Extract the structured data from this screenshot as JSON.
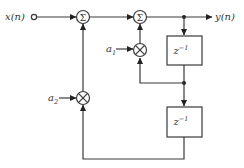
{
  "diagram": {
    "type": "second-order IIR filter block diagram",
    "input_label": "x(n)",
    "output_label": "y(n)",
    "adders": [
      {
        "id": "sum1",
        "symbol": "Σ"
      },
      {
        "id": "sum2",
        "symbol": "Σ"
      }
    ],
    "multipliers": [
      {
        "id": "mul1",
        "coefficient": "a",
        "subscript": "1"
      },
      {
        "id": "mul2",
        "coefficient": "a",
        "subscript": "2"
      }
    ],
    "delays": [
      {
        "id": "delay1",
        "base": "z",
        "exponent": "−1"
      },
      {
        "id": "delay2",
        "base": "z",
        "exponent": "−1"
      }
    ],
    "colors": {
      "line": "#3a3a3a",
      "text": "#333333",
      "background": "#ffffff"
    }
  }
}
